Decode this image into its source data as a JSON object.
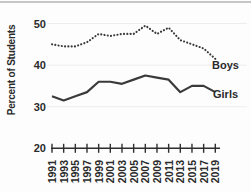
{
  "window": {
    "background": "#ffffff",
    "top_border_color": "#c6c6c6"
  },
  "chart_data": {
    "type": "line",
    "title": "",
    "xlabel": "",
    "ylabel": "Percent of Students",
    "x": [
      1991,
      1993,
      1995,
      1997,
      1999,
      2001,
      2003,
      2005,
      2007,
      2009,
      2011,
      2013,
      2015,
      2017,
      2019
    ],
    "xlim": [
      1991,
      2019
    ],
    "ylim": [
      20,
      52
    ],
    "yticks": [
      50,
      40,
      30,
      20
    ],
    "gridlines_at": [
      50,
      40,
      30
    ],
    "grid": "horizontal light gray lines at 30, 40, 50",
    "legend_position": "labels at right end of each line",
    "axis_color": "#2f2f2f",
    "grid_color": "#ededed",
    "text_color": "#2b2b2b",
    "line_color": "#3a3a3a",
    "series": [
      {
        "name": "Boys",
        "style": "dotted",
        "color": "#3a3a3a",
        "values": [
          45,
          44.5,
          44.5,
          45.5,
          47.5,
          47,
          47.5,
          47.5,
          49.5,
          47.5,
          49,
          46,
          45,
          44,
          41.5
        ]
      },
      {
        "name": "Girls",
        "style": "solid",
        "color": "#3a3a3a",
        "values": [
          32.5,
          31.5,
          32.5,
          33.5,
          36,
          36,
          35.5,
          36.5,
          37.5,
          37,
          36.5,
          33.5,
          35,
          35,
          33.5
        ]
      }
    ]
  }
}
